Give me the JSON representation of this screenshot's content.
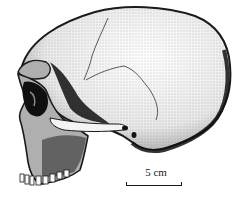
{
  "figure": {
    "colors": {
      "ink": "#1a1a1a",
      "paper": "#ffffff",
      "shade": "#555555"
    }
  },
  "scale_bar": {
    "label": "5 cm"
  }
}
